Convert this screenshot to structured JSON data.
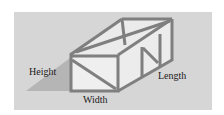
{
  "diagram": {
    "type": "box-frame-dimensions",
    "labels": {
      "height": "Height",
      "width": "Width",
      "length": "Length"
    },
    "colors": {
      "background_panel": "#d6d6d6",
      "frame_stroke": "#7f7f7f",
      "face_fill": "#ececec",
      "shadow": "#b5b5b5"
    }
  }
}
